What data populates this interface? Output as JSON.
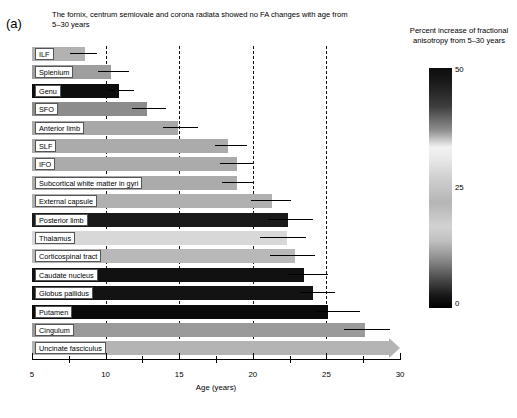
{
  "figure": {
    "panel_label": "(a)",
    "caption": "The fornix, centrum semiovale and corona radiata showed no FA changes with age from 5–30 years"
  },
  "axis": {
    "x_title": "Age (years)",
    "x_ticklabels": [
      "5",
      "10",
      "15",
      "20",
      "25",
      "30"
    ],
    "x_major_ticks": [
      5,
      10,
      15,
      20,
      25,
      30
    ],
    "x_minor_ticks": [
      7.5,
      12.5,
      17.5,
      22.5,
      27.5
    ],
    "gridlines": [
      10,
      15,
      20,
      25
    ]
  },
  "legend": {
    "title": "Percent increase of fractional anisotropy from 5–30 years",
    "max_label": "50",
    "mid_label": "25",
    "min_label": "0",
    "colors": {
      "dark": "#0d0d0d",
      "light": "#f2f2f2",
      "mid": "#b5b5b5"
    }
  },
  "chart_data": {
    "type": "bar",
    "orientation": "horizontal",
    "title": "The fornix, centrum semiovale and corona radiata showed no FA changes with age from 5–30 years",
    "xlabel": "Age (years)",
    "ylabel": "",
    "xlim": [
      5,
      30
    ],
    "grid": true,
    "grid_positions": [
      10,
      15,
      20,
      25
    ],
    "colorbar": {
      "label": "Percent increase of fractional anisotropy from 5–30 years",
      "ticks": [
        0,
        25,
        50
      ],
      "vmin": 0,
      "vmax": 50
    },
    "categories": [
      "ILF",
      "Splenium",
      "Genu",
      "SFO",
      "Anterior limb",
      "SLF",
      "IFO",
      "Subcortical white matter in gyri",
      "External capsule",
      "Posterior limb",
      "Thalamus",
      "Corticospinal tract",
      "Caudate nucleus",
      "Globus pallidus",
      "Putamen",
      "Cingulum",
      "Uncinate fasciculus"
    ],
    "values": [
      8.6,
      10.4,
      10.9,
      12.8,
      14.9,
      18.3,
      18.9,
      18.9,
      21.3,
      22.4,
      22.3,
      22.9,
      23.5,
      24.1,
      25.1,
      27.6,
      30.0
    ],
    "err_low": [
      7.6,
      9.5,
      10.2,
      11.8,
      13.9,
      17.4,
      17.8,
      17.9,
      19.9,
      21.0,
      20.5,
      21.2,
      22.4,
      23.2,
      24.3,
      26.2,
      28.8
    ],
    "err_high": [
      9.4,
      11.6,
      11.9,
      14.1,
      16.3,
      19.6,
      20.0,
      20.0,
      22.6,
      24.1,
      23.6,
      24.2,
      25.1,
      25.6,
      27.3,
      29.3,
      30.0
    ],
    "fa_percent_increase": [
      27,
      26,
      48,
      33,
      26,
      25,
      25,
      25,
      24,
      49,
      20,
      24,
      46,
      47,
      50,
      24,
      22
    ],
    "bar_colors": [
      "#b2b2b2",
      "#9e9e9e",
      "#0d0d0d",
      "#8c8c8c",
      "#a8a8a8",
      "#ababab",
      "#ababab",
      "#ababab",
      "#b0b0b0",
      "#1a1a1a",
      "#d8d8d8",
      "#b8b8b8",
      "#111111",
      "#131313",
      "#0a0a0a",
      "#9a9a9a",
      "#b4b4b4"
    ],
    "arrow_last_bar": true
  }
}
